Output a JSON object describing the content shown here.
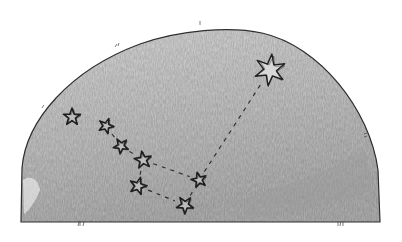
{
  "illustration": {
    "subject": "sketch of a constellation on a semicircular sky dome",
    "colors": {
      "background": "#ffffff",
      "dome_light": "#d6d6d6",
      "dome_mid": "#c4c4c4",
      "dome_dark": "#a9a9a9",
      "outline": "#2e2e2e",
      "star_stroke": "#1f1f1f"
    },
    "dome": {
      "left_x": 21,
      "right_x": 380,
      "bottom_y": 222,
      "top_y": 27,
      "side_top_y": 160
    },
    "stars": [
      {
        "name": "star-1",
        "x": 72,
        "y": 117,
        "size": 9
      },
      {
        "name": "star-2",
        "x": 106,
        "y": 126,
        "size": 8
      },
      {
        "name": "star-3",
        "x": 121,
        "y": 146,
        "size": 8
      },
      {
        "name": "star-4",
        "x": 143,
        "y": 160,
        "size": 9
      },
      {
        "name": "star-5",
        "x": 138,
        "y": 186,
        "size": 9
      },
      {
        "name": "star-6",
        "x": 185,
        "y": 205,
        "size": 9
      },
      {
        "name": "star-7",
        "x": 199,
        "y": 180,
        "size": 8
      },
      {
        "name": "bright-star",
        "x": 270,
        "y": 70,
        "size": 16
      }
    ],
    "connections": [
      [
        "star-2",
        "star-3"
      ],
      [
        "star-3",
        "star-4"
      ],
      [
        "star-4",
        "star-5"
      ],
      [
        "star-5",
        "star-6"
      ],
      [
        "star-4",
        "star-7"
      ],
      [
        "star-7",
        "bright-star"
      ],
      [
        "star-6",
        "star-7"
      ]
    ]
  }
}
